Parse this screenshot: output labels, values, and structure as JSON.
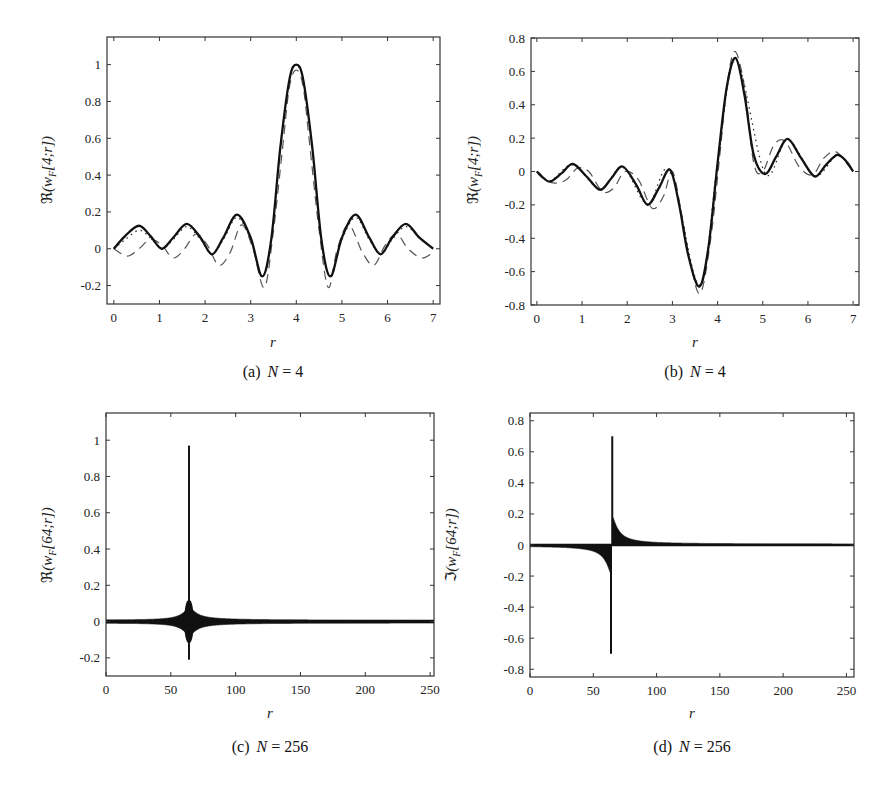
{
  "chart_data": [
    {
      "id": "a",
      "type": "line",
      "caption_prefix": "(a)",
      "caption_var": "N",
      "caption_value": "= 4",
      "xlabel": "r",
      "ylabel": "ℜ(w_F[4;r])",
      "xlim": [
        -0.15,
        7.15
      ],
      "ylim": [
        -0.3,
        1.15
      ],
      "xticks": [
        0,
        1,
        2,
        3,
        4,
        5,
        6,
        7
      ],
      "yticks": [
        -0.2,
        0,
        0.2,
        0.4,
        0.6,
        0.8,
        1
      ],
      "ytick_labels": [
        "-0.2",
        "0",
        "0.2",
        "0.4",
        "0.6",
        "0.8",
        "1"
      ],
      "grid": false,
      "series": [
        {
          "name": "solid",
          "style": "solid",
          "x": [
            0,
            0.25,
            0.55,
            0.8,
            1.05,
            1.3,
            1.6,
            1.9,
            2.15,
            2.4,
            2.7,
            3.0,
            3.25,
            3.45,
            3.65,
            3.85,
            4.0,
            4.15,
            4.35,
            4.55,
            4.75,
            5.0,
            5.3,
            5.6,
            5.85,
            6.1,
            6.4,
            6.7,
            7.0
          ],
          "y": [
            0,
            0.07,
            0.125,
            0.07,
            0,
            0.06,
            0.135,
            0.06,
            -0.03,
            0.06,
            0.185,
            0.06,
            -0.15,
            0.05,
            0.55,
            0.92,
            1.0,
            0.92,
            0.55,
            0.05,
            -0.15,
            0.06,
            0.185,
            0.06,
            -0.03,
            0.06,
            0.135,
            0.06,
            0
          ]
        },
        {
          "name": "dotted",
          "style": "dotted",
          "x": [
            0,
            0.25,
            0.55,
            0.8,
            1.05,
            1.3,
            1.6,
            1.9,
            2.15,
            2.4,
            2.7,
            3.0,
            3.25,
            3.45,
            3.65,
            3.85,
            4.0,
            4.15,
            4.35,
            4.55,
            4.75,
            5.0,
            5.3,
            5.6,
            5.85,
            6.1,
            6.4,
            6.7,
            7.0
          ],
          "y": [
            0,
            0.05,
            0.1,
            0.06,
            0,
            0.05,
            0.12,
            0.05,
            -0.03,
            0.05,
            0.17,
            0.05,
            -0.15,
            0.05,
            0.55,
            0.92,
            0.99,
            0.92,
            0.55,
            0.05,
            -0.15,
            0.05,
            0.17,
            0.05,
            -0.03,
            0.05,
            0.12,
            0.06,
            0
          ]
        },
        {
          "name": "dashed",
          "style": "dashed",
          "x": [
            0,
            0.3,
            0.55,
            0.8,
            1.05,
            1.3,
            1.55,
            1.8,
            2.05,
            2.3,
            2.55,
            2.8,
            3.05,
            3.3,
            3.5,
            3.7,
            3.85,
            4.0,
            4.15,
            4.3,
            4.5,
            4.7,
            4.9,
            5.15,
            5.45,
            5.7,
            5.95,
            6.2,
            6.45,
            6.75,
            7.0
          ],
          "y": [
            0,
            -0.04,
            0.0,
            0.05,
            0.02,
            -0.05,
            0.0,
            0.08,
            0.02,
            -0.09,
            -0.02,
            0.13,
            0.0,
            -0.21,
            0.1,
            0.55,
            0.88,
            0.97,
            0.88,
            0.55,
            0.1,
            -0.21,
            0.0,
            0.13,
            -0.02,
            -0.09,
            0.02,
            0.08,
            0.0,
            -0.05,
            -0.02
          ]
        }
      ]
    },
    {
      "id": "b",
      "type": "line",
      "caption_prefix": "(b)",
      "caption_var": "N",
      "caption_value": "= 4",
      "xlabel": "r",
      "ylabel": "ℜ(w_F[4;r])",
      "xlim": [
        -0.13,
        7.13
      ],
      "ylim": [
        -0.8,
        0.8
      ],
      "xticks": [
        0,
        1,
        2,
        3,
        4,
        5,
        6,
        7
      ],
      "yticks": [
        -0.8,
        -0.6,
        -0.4,
        -0.2,
        0,
        0.2,
        0.4,
        0.6,
        0.8
      ],
      "ytick_labels": [
        "-0.8",
        "-0.6",
        "-0.4",
        "-0.2",
        "0",
        "0.2",
        "0.4",
        "0.6",
        "0.8"
      ],
      "grid": false,
      "series": [
        {
          "name": "solid",
          "style": "solid",
          "x": [
            0,
            0.15,
            0.3,
            0.55,
            0.8,
            1.1,
            1.4,
            1.65,
            1.9,
            2.2,
            2.45,
            2.7,
            2.95,
            3.15,
            3.35,
            3.6,
            3.8,
            4.0,
            4.2,
            4.4,
            4.6,
            4.8,
            5.05,
            5.3,
            5.55,
            5.85,
            6.15,
            6.4,
            6.65,
            6.85,
            7.0
          ],
          "y": [
            0,
            -0.04,
            -0.06,
            -0.01,
            0.045,
            -0.03,
            -0.11,
            -0.04,
            0.03,
            -0.08,
            -0.2,
            -0.1,
            0.01,
            -0.2,
            -0.5,
            -0.69,
            -0.45,
            0.05,
            0.5,
            0.68,
            0.45,
            0.1,
            -0.015,
            0.09,
            0.195,
            0.08,
            -0.03,
            0.04,
            0.1,
            0.06,
            0
          ]
        },
        {
          "name": "dashed",
          "style": "dashed",
          "x": [
            0,
            0.2,
            0.4,
            0.65,
            0.9,
            1.15,
            1.45,
            1.7,
            1.95,
            2.25,
            2.55,
            2.8,
            3.0,
            3.2,
            3.4,
            3.62,
            3.85,
            4.05,
            4.2,
            4.38,
            4.6,
            4.8,
            5.0,
            5.25,
            5.5,
            5.8,
            6.1,
            6.35,
            6.6,
            6.85,
            7.0
          ],
          "y": [
            0,
            -0.05,
            -0.07,
            -0.05,
            0.02,
            0.0,
            -0.12,
            -0.1,
            0.0,
            -0.05,
            -0.22,
            -0.15,
            0.0,
            -0.25,
            -0.55,
            -0.73,
            -0.4,
            0.1,
            0.5,
            0.72,
            0.5,
            0.05,
            0.0,
            0.16,
            0.18,
            0.03,
            -0.02,
            0.08,
            0.12,
            0.05,
            0
          ]
        },
        {
          "name": "dotted",
          "style": "dotted",
          "x": [
            0,
            0.3,
            0.8,
            1.4,
            1.9,
            2.45,
            2.95,
            3.6,
            4.0,
            4.4,
            5.05,
            5.55,
            6.15,
            6.65,
            7.0
          ],
          "y": [
            0,
            -0.055,
            0.04,
            -0.105,
            0.025,
            -0.195,
            0.005,
            -0.68,
            0.05,
            0.67,
            -0.01,
            0.19,
            -0.025,
            0.095,
            0
          ]
        }
      ]
    },
    {
      "id": "c",
      "type": "line",
      "caption_prefix": "(c)",
      "caption_var": "N",
      "caption_value": "= 256",
      "xlabel": "r",
      "ylabel": "ℜ(w_F[64;r])",
      "xlim": [
        0,
        253
      ],
      "ylim": [
        -0.3,
        1.15
      ],
      "xticks": [
        0,
        50,
        100,
        150,
        200,
        250
      ],
      "yticks": [
        -0.2,
        0,
        0.2,
        0.4,
        0.6,
        0.8,
        1
      ],
      "ytick_labels": [
        "-0.2",
        "0",
        "0.2",
        "0.4",
        "0.6",
        "0.8",
        "1"
      ],
      "grid": false,
      "spike": {
        "x": 64,
        "ymax": 0.97,
        "ymin": -0.21
      },
      "envelope": {
        "center": 64,
        "near_peak_amplitude": 0.12,
        "baseline_amplitude": 0.008,
        "decay_width": 6
      },
      "series": [
        {
          "name": "oscillation",
          "style": "filled-band",
          "description": "dense oscillation with envelope peaking at r=64"
        }
      ]
    },
    {
      "id": "d",
      "type": "line",
      "caption_prefix": "(d)",
      "caption_var": "N",
      "caption_value": "= 256",
      "xlabel": "r",
      "ylabel": "ℑ(w_F[64;r])",
      "xlim": [
        0,
        256
      ],
      "ylim": [
        -0.85,
        0.85
      ],
      "xticks": [
        0,
        50,
        100,
        150,
        200,
        250
      ],
      "yticks": [
        -0.8,
        -0.6,
        -0.4,
        -0.2,
        0,
        0.2,
        0.4,
        0.6,
        0.8
      ],
      "ytick_labels": [
        "-0.8",
        "-0.6",
        "-0.4",
        "-0.2",
        "0",
        "0.2",
        "0.4",
        "0.6",
        "0.8"
      ],
      "grid": false,
      "spike_pos": {
        "x": 65,
        "y": 0.7
      },
      "spike_neg": {
        "x": 64,
        "y": -0.7
      },
      "tail": {
        "left_sign": -1,
        "right_sign": 1,
        "amplitude_near": 0.2,
        "decay_width": 5
      },
      "series": [
        {
          "name": "oscillation",
          "style": "filled-band",
          "description": "antisymmetric 1/x-like tails around r=64"
        }
      ]
    }
  ],
  "panels": {
    "a": {
      "caption_prefix": "(a)",
      "caption_var": "N",
      "caption_value": "= 4",
      "xlabel": "r",
      "ylabel_sym": "ℜ",
      "ylabel_arg": "(w",
      "ylabel_sub": "F",
      "ylabel_rest": "[4;r])"
    },
    "b": {
      "caption_prefix": "(b)",
      "caption_var": "N",
      "caption_value": "= 4",
      "xlabel": "r",
      "ylabel_sym": "ℜ",
      "ylabel_arg": "(w",
      "ylabel_sub": "F",
      "ylabel_rest": "[4;r])"
    },
    "c": {
      "caption_prefix": "(c)",
      "caption_var": "N",
      "caption_value": "= 256",
      "xlabel": "r",
      "ylabel_sym": "ℜ",
      "ylabel_arg": "(w",
      "ylabel_sub": "F",
      "ylabel_rest": "[64;r])"
    },
    "d": {
      "caption_prefix": "(d)",
      "caption_var": "N",
      "caption_value": "= 256",
      "xlabel": "r",
      "ylabel_sym": "ℑ",
      "ylabel_arg": "(w",
      "ylabel_sub": "F",
      "ylabel_rest": "[64;r])"
    }
  },
  "layout": {
    "a": {
      "left": 107,
      "top": 37,
      "right": 440,
      "bottom": 304
    },
    "b": {
      "left": 531,
      "top": 38,
      "right": 859,
      "bottom": 305
    },
    "c": {
      "left": 106,
      "top": 413,
      "right": 434,
      "bottom": 676
    },
    "d": {
      "left": 530,
      "top": 413,
      "right": 854,
      "bottom": 677
    }
  }
}
